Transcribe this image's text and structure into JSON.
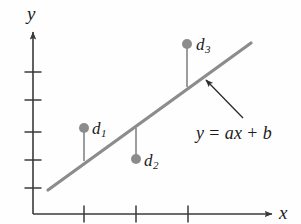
{
  "figure": {
    "type": "scatter-with-fit-line",
    "background_color": "#fefefe",
    "axis_color": "#3a3a3a",
    "line_color": "#8c8c8c",
    "point_color": "#8c8c8c",
    "text_color": "#1b1b1b",
    "axes": {
      "x_label": "x",
      "y_label": "y",
      "x_axis_y": 214,
      "y_axis_x": 33,
      "x_ticks": [
        84,
        136,
        188
      ],
      "y_ticks": [
        72,
        100,
        132,
        160,
        188
      ]
    },
    "fit_line": {
      "x1": 48,
      "y1": 190,
      "x2": 251,
      "y2": 43
    },
    "annotation": {
      "equation": "y = ax + b",
      "equation_parts": {
        "lhs": "y",
        "equals": "=",
        "slope": "a",
        "variable": "x",
        "plus": "+",
        "intercept": "b"
      },
      "arrow_from_x": 243,
      "arrow_from_y": 118,
      "arrow_to_x": 206,
      "arrow_to_y": 80
    },
    "points": [
      {
        "id": "d1",
        "label": "d",
        "subscript": "1",
        "cx": 84,
        "cy": 128,
        "stem_to_y": 161,
        "label_x": 92,
        "label_y": 120
      },
      {
        "id": "d2",
        "label": "d",
        "subscript": "2",
        "cx": 136,
        "cy": 159,
        "stem_to_y": 128,
        "label_x": 144,
        "label_y": 152
      },
      {
        "id": "d3",
        "label": "d",
        "subscript": "3",
        "cx": 187,
        "cy": 44,
        "stem_to_y": 87,
        "label_x": 196,
        "label_y": 36
      }
    ]
  }
}
